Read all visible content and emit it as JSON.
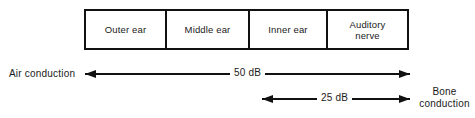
{
  "figure": {
    "line_color": "#111111",
    "background": "#ffffff"
  },
  "pathway": {
    "segments": [
      {
        "label": "Outer ear"
      },
      {
        "label": "Middle ear"
      },
      {
        "label": "Inner ear"
      },
      {
        "label": "Auditory\nnerve"
      }
    ]
  },
  "measures": {
    "air": {
      "side_label": "Air conduction",
      "value_label": "50 dB",
      "span_from": "Outer ear",
      "span_to": "Auditory nerve",
      "arrow_style": "double-headed"
    },
    "bone": {
      "side_label": "Bone\nconduction",
      "value_label": "25 dB",
      "span_from": "Inner ear",
      "span_to": "Auditory nerve",
      "arrow_style": "double-headed"
    }
  }
}
